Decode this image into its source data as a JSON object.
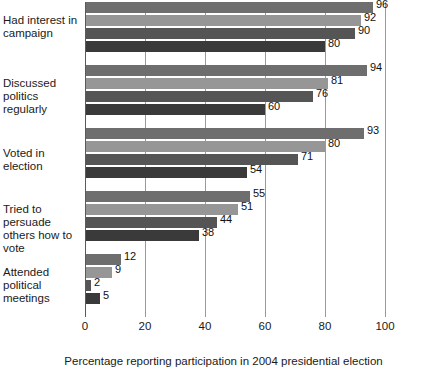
{
  "chart_data": {
    "type": "bar",
    "orientation": "horizontal",
    "title": "",
    "xlabel": "Percentage reporting participation in 2004 presidential election",
    "ylabel": "",
    "xlim": [
      0,
      100
    ],
    "xticks": [
      0,
      20,
      40,
      60,
      80,
      100
    ],
    "grid": true,
    "legend": "none",
    "categories": [
      "Had interest in campaign",
      "Discussed politics regularly",
      "Voted in election",
      "Tried to persuade others how to vote",
      "Attended political meetings"
    ],
    "series": [
      {
        "name": "series-1",
        "color": "#6e6e6e",
        "values": [
          96,
          94,
          93,
          55,
          12
        ]
      },
      {
        "name": "series-2",
        "color": "#969696",
        "values": [
          92,
          81,
          80,
          51,
          9
        ]
      },
      {
        "name": "series-3",
        "color": "#555555",
        "values": [
          90,
          76,
          71,
          44,
          2
        ]
      },
      {
        "name": "series-4",
        "color": "#3a3a3a",
        "values": [
          80,
          60,
          54,
          38,
          5
        ]
      }
    ]
  },
  "axis": {
    "tick_labels": [
      "0",
      "20",
      "40",
      "60",
      "80",
      "100"
    ],
    "caption": "Percentage reporting participation in 2004 presidential election"
  },
  "category_labels": [
    {
      "line1": "Had interest in",
      "line2": "campaign"
    },
    {
      "line1": "Discussed politics",
      "line2": "regularly"
    },
    {
      "line1": "Voted in election",
      "line2": ""
    },
    {
      "line1": "Tried to persuade",
      "line2": "others how to vote"
    },
    {
      "line1": "Attended political",
      "line2": "meetings"
    }
  ]
}
